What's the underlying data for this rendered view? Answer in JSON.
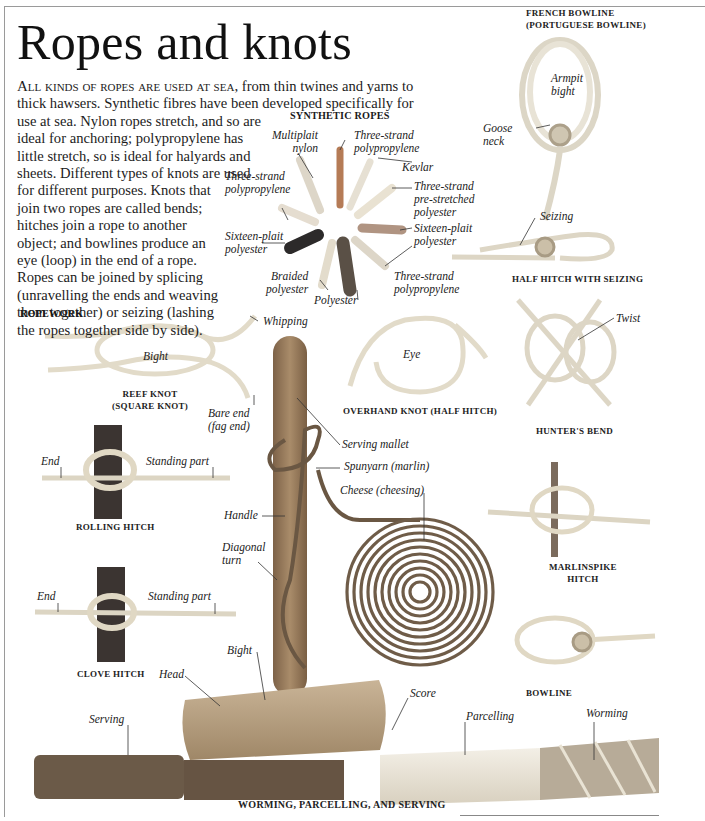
{
  "page": {
    "title": "Ropes and knots",
    "intro": {
      "lead": "All kinds of ropes are used at sea,",
      "lines": [
        " from thin twines and yarns to",
        "thick hawsers. Synthetic fibres have been developed specifically for",
        "use at sea. Nylon ropes stretch, and so are",
        "ideal for anchoring; polypropylene has",
        "little stretch, so is ideal for halyards and",
        "sheets. Different types of knots are used",
        "for different purposes. Knots that",
        "join two ropes are called bends;",
        "hitches join a rope to another",
        "object; and bowlines produce an",
        "eye (loop) in the end of a rope.",
        "Ropes can be joined by splicing",
        "(unravelling the ends and weaving",
        "them together) or seizing (lashing",
        "the ropes together side by side)."
      ]
    }
  },
  "synthetic_ropes": {
    "heading": "SYNTHETIC ROPES",
    "labels": {
      "multiplait_nylon": [
        "Multiplait",
        "nylon"
      ],
      "three_strand_pp_top": [
        "Three-strand",
        "polypropylene"
      ],
      "kevlar": [
        "Kevlar"
      ],
      "three_strand_prestretched": [
        "Three-strand",
        "pre-stretched",
        "polyester"
      ],
      "sixteen_plait_right": [
        "Sixteen-plait",
        "polyester"
      ],
      "three_strand_pp_bottom": [
        "Three-strand",
        "polypropylene"
      ],
      "polyester": [
        "Polyester"
      ],
      "braided_polyester": [
        "Braided",
        "polyester"
      ],
      "sixteen_plait_left": [
        "Sixteen-plait",
        "polyester"
      ],
      "three_strand_pp_left": [
        "Three-strand",
        "polypropylene"
      ]
    }
  },
  "french_bowline": {
    "caption": [
      "FRENCH BOWLINE",
      "(PORTUGUESE BOWLINE)"
    ],
    "labels": {
      "armpit_bight": [
        "Armpit",
        "bight"
      ],
      "goose_neck": [
        "Goose",
        "neck"
      ]
    }
  },
  "half_hitch_seizing": {
    "caption": "HALF HITCH WITH SEIZING",
    "labels": {
      "seizing": "Seizing"
    }
  },
  "hunters_bend": {
    "caption": "HUNTER'S BEND",
    "labels": {
      "twist": "Twist"
    }
  },
  "ropework": {
    "heading": "ROPEWORK",
    "reef_knot": {
      "caption": [
        "REEF KNOT",
        "(SQUARE KNOT)"
      ],
      "labels": {
        "bight": "Bight",
        "whipping": "Whipping",
        "bare_end": [
          "Bare end",
          "(fag end)"
        ]
      }
    },
    "overhand_knot": {
      "caption": "OVERHAND KNOT (HALF HITCH)",
      "labels": {
        "eye": "Eye"
      }
    },
    "rolling_hitch": {
      "caption": "ROLLING HITCH",
      "labels": {
        "end": "End",
        "standing_part": "Standing part"
      }
    },
    "clove_hitch": {
      "caption": "CLOVE HITCH",
      "labels": {
        "end": "End",
        "standing_part": "Standing part"
      }
    },
    "marlinspike_hitch": {
      "caption": [
        "MARLINSPIKE",
        "HITCH"
      ]
    },
    "bowline": {
      "caption": "BOWLINE"
    },
    "mallet": {
      "labels": {
        "serving_mallet": "Serving mallet",
        "spunyarn": "Spunyarn (marlin)",
        "cheese": "Cheese (cheesing)",
        "handle": "Handle",
        "diagonal_turn": [
          "Diagonal",
          "turn"
        ],
        "bight": "Bight",
        "head": "Head",
        "score": "Score"
      }
    }
  },
  "worming": {
    "caption": "WORMING, PARCELLING, AND SERVING",
    "labels": {
      "serving": "Serving",
      "parcelling": "Parcelling",
      "worming": "Worming"
    }
  },
  "colors": {
    "text": "#1a1a1a",
    "rope": "#e9e3d2",
    "rope_shadow": "#b9b09a",
    "wood": "#9c7f5e",
    "dark_rope": "#5c4a38"
  }
}
